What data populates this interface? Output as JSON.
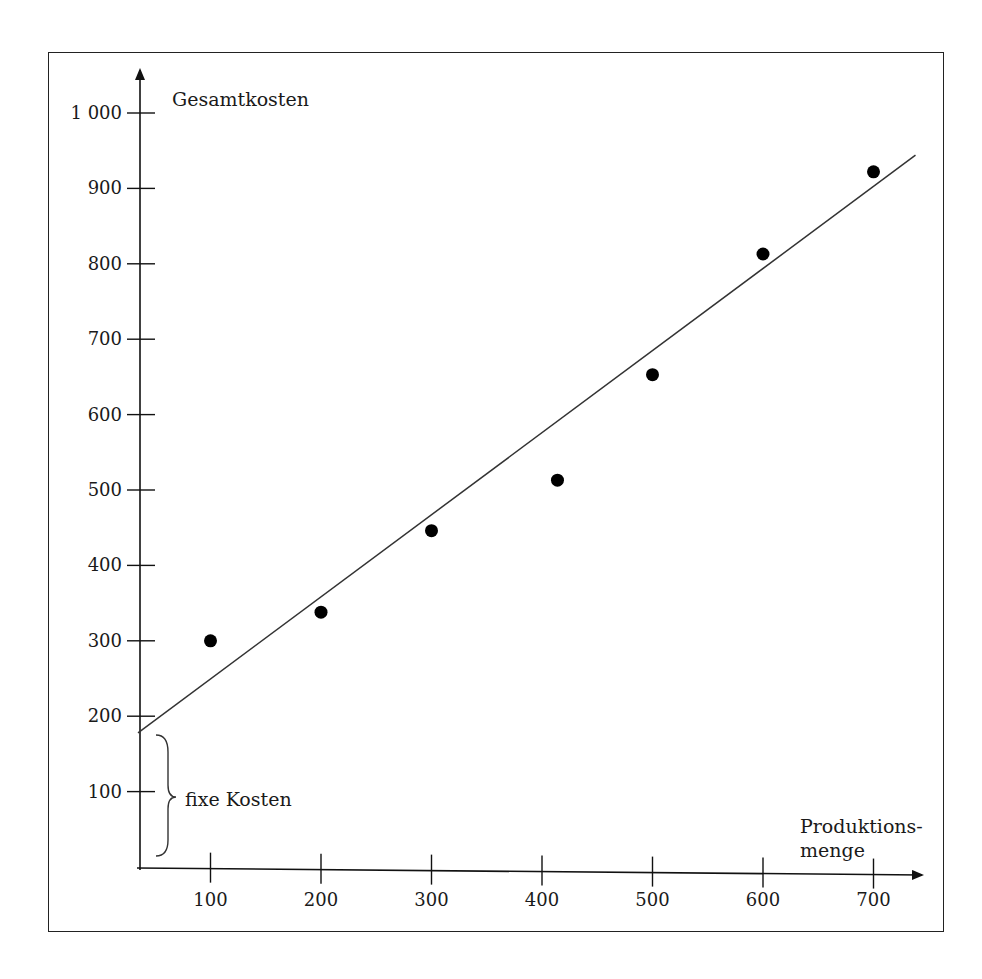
{
  "header": {
    "partial_text": "…ung"
  },
  "chart_data": {
    "type": "scatter",
    "title": "",
    "ylabel": "Gesamtkosten",
    "xlabel": "Produktions-menge",
    "xlabel_lines": [
      "Produktions-",
      "menge"
    ],
    "x_ticks": [
      100,
      200,
      300,
      400,
      500,
      600,
      700
    ],
    "y_ticks": [
      100,
      200,
      300,
      400,
      500,
      600,
      700,
      800,
      900,
      1000
    ],
    "y_tick_labels": [
      "100",
      "200",
      "300",
      "400",
      "500",
      "600",
      "700",
      "800",
      "900",
      "1 000"
    ],
    "x_tick_labels": [
      "100",
      "200",
      "300",
      "400",
      "500",
      "600",
      "700"
    ],
    "xlim": [
      0,
      750
    ],
    "ylim": [
      0,
      1050
    ],
    "grid": false,
    "legend": null,
    "series": [
      {
        "name": "Beobachtungen",
        "type": "scatter",
        "points": [
          {
            "x": 100,
            "y": 300
          },
          {
            "x": 200,
            "y": 338
          },
          {
            "x": 300,
            "y": 446
          },
          {
            "x": 414,
            "y": 513
          },
          {
            "x": 500,
            "y": 653
          },
          {
            "x": 600,
            "y": 813
          },
          {
            "x": 700,
            "y": 922
          }
        ]
      },
      {
        "name": "Regressionsgerade",
        "type": "line",
        "points": [
          {
            "x": 33,
            "y": 178
          },
          {
            "x": 738,
            "y": 944
          }
        ]
      }
    ],
    "annotations": [
      {
        "text": "fixe Kosten",
        "type": "brace",
        "y_from": 15,
        "y_to": 175
      }
    ]
  },
  "annotations": {
    "fixed_costs_label": "fixe Kosten"
  }
}
